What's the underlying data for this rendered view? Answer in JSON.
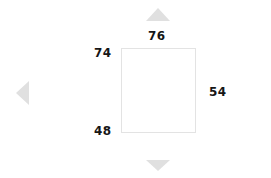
{
  "diagram": {
    "type": "dimension-measurement",
    "shape": "rectangle",
    "background_color": "#ffffff",
    "box": {
      "fill_color": "#ffffff",
      "border_color": "#e3e3e3"
    },
    "label_color": "#161616",
    "arrow_color": "#e0e0e0",
    "dimensions": {
      "top": "76",
      "top_left": "74",
      "bottom_left": "48",
      "right": "54"
    },
    "arrows": {
      "up": "triangle-up-icon",
      "down": "triangle-down-icon",
      "left": "triangle-left-icon"
    }
  }
}
